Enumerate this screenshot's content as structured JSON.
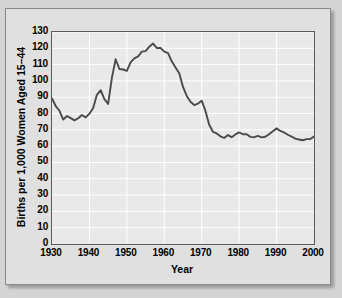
{
  "chart_data": {
    "type": "line",
    "title": "",
    "xlabel": "Year",
    "ylabel": "Births per 1,000 Women Aged 15-44",
    "xlim": [
      1930,
      2000
    ],
    "ylim": [
      0,
      130
    ],
    "xticks": [
      1930,
      1940,
      1950,
      1960,
      1970,
      1980,
      1990,
      2000
    ],
    "yticks": [
      0,
      10,
      20,
      30,
      40,
      50,
      60,
      70,
      80,
      90,
      100,
      110,
      120,
      130
    ],
    "grid": true,
    "legend": "none",
    "line_color": "#4a4a4a",
    "plot_background": "#e9e9e9",
    "gridline_color": "#ffffff",
    "series": [
      {
        "name": "General fertility rate",
        "x": [
          1930,
          1931,
          1932,
          1933,
          1934,
          1935,
          1936,
          1937,
          1938,
          1939,
          1940,
          1941,
          1942,
          1943,
          1944,
          1945,
          1946,
          1947,
          1948,
          1949,
          1950,
          1951,
          1952,
          1953,
          1954,
          1955,
          1956,
          1957,
          1958,
          1959,
          1960,
          1961,
          1962,
          1963,
          1964,
          1965,
          1966,
          1967,
          1968,
          1969,
          1970,
          1971,
          1972,
          1973,
          1974,
          1975,
          1976,
          1977,
          1978,
          1979,
          1980,
          1981,
          1982,
          1983,
          1984,
          1985,
          1986,
          1987,
          1988,
          1989,
          1990,
          1991,
          1992,
          1993,
          1994,
          1995,
          1996,
          1997,
          1998,
          1999,
          2000
        ],
        "values": [
          89.2,
          84.6,
          81.7,
          76.3,
          78.5,
          77.2,
          75.8,
          77.1,
          79.1,
          77.6,
          79.9,
          83.4,
          91.5,
          94.3,
          88.8,
          85.9,
          101.9,
          113.3,
          107.3,
          107.0,
          106.2,
          111.4,
          113.8,
          115.0,
          118.0,
          118.3,
          121.0,
          122.9,
          120.2,
          120.2,
          118.0,
          117.1,
          112.0,
          108.3,
          104.7,
          96.3,
          90.8,
          87.2,
          85.2,
          86.1,
          87.9,
          81.6,
          73.1,
          68.8,
          67.8,
          66.0,
          65.0,
          66.8,
          65.5,
          67.2,
          68.4,
          67.3,
          67.3,
          65.7,
          65.5,
          66.3,
          65.4,
          65.8,
          67.3,
          69.2,
          70.9,
          69.3,
          68.4,
          67.0,
          65.9,
          64.6,
          64.1,
          63.6,
          64.3,
          64.4,
          65.9
        ]
      }
    ]
  },
  "axes": {
    "x_tick_labels": [
      "1930",
      "1940",
      "1950",
      "1960",
      "1970",
      "1980",
      "1990",
      "2000"
    ],
    "y_tick_labels": [
      "0",
      "10",
      "20",
      "30",
      "40",
      "50",
      "60",
      "70",
      "80",
      "90",
      "100",
      "110",
      "120",
      "130"
    ],
    "x_axis_title": "Year",
    "y_axis_title": "Births per 1,000 Women Aged 15–44"
  }
}
